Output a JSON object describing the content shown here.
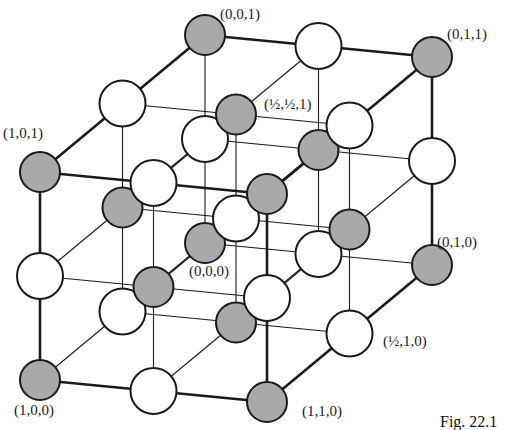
{
  "figure": {
    "caption": "Fig. 22.1"
  },
  "colors": {
    "shaded_sphere_fill": "#a9a9a9",
    "open_sphere_fill": "#ffffff",
    "stroke": "#1a1a1a",
    "background": "#ffffff"
  },
  "projection": {
    "origin": [
      205,
      243
    ],
    "x_vector": [
      -165,
      137
    ],
    "y_vector": [
      227,
      22
    ],
    "z_vector": [
      0,
      -208
    ]
  },
  "sphere_radius": {
    "shaded": 20,
    "open": 23
  },
  "labels": [
    {
      "text": "(0,0,1)",
      "x": 220,
      "y": 19
    },
    {
      "text": "(0,1,1)",
      "x": 447,
      "y": 39
    },
    {
      "text": "(1,0,1)",
      "x": 3,
      "y": 138
    },
    {
      "text": "(½,½,1)",
      "x": 264,
      "y": 109,
      "fraction": true,
      "parts": [
        "1",
        "2",
        "1",
        "2",
        "1"
      ]
    },
    {
      "text": "(0,1,0)",
      "x": 437,
      "y": 247
    },
    {
      "text": "(0,0,0)",
      "x": 189,
      "y": 276
    },
    {
      "text": "(½,1,0)",
      "x": 383,
      "y": 346,
      "fraction": true,
      "parts": [
        "1",
        "2",
        "1",
        "0"
      ]
    },
    {
      "text": "(1,0,0)",
      "x": 14,
      "y": 415
    },
    {
      "text": "(1,1,0)",
      "x": 302,
      "y": 416
    }
  ],
  "lattice_points_note": "27 sites at coordinates {0, 1/2, 1}^3; shaded when 2(x+y+z) is even"
}
